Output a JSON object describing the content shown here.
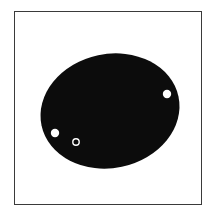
{
  "figure": {
    "background": "#ffffff",
    "frame": {
      "stroke": "#3a3a3a"
    },
    "ellipse": {
      "cx": 110,
      "cy": 111,
      "rx": 70,
      "ry": 57,
      "rotation": -12,
      "fill": "#0c0c0c"
    },
    "dots": [
      {
        "name": "right-dot",
        "cx": 167,
        "cy": 94,
        "r": 4.2,
        "fill": "#ffffff"
      },
      {
        "name": "left-dot",
        "cx": 55,
        "cy": 133,
        "r": 4.2,
        "fill": "#ffffff"
      }
    ],
    "ring": {
      "cx": 76,
      "cy": 142,
      "r": 3.2,
      "stroke": "#ffffff",
      "stroke_width": 1.4
    }
  }
}
